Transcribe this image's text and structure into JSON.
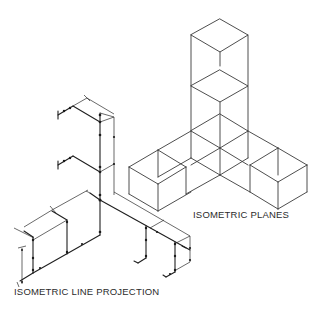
{
  "figure": {
    "labels": {
      "isometric_planes": "ISOMETRIC PLANES",
      "isometric_line_projection": "ISOMETRIC LINE PROJECTION"
    },
    "colors": {
      "background": "#ffffff",
      "line": "#3a3a3a",
      "text": "#2b2b2b"
    },
    "sections": [
      {
        "id": "isometric-planes",
        "description": "Stacked isometric cube wireframes in T arrangement"
      },
      {
        "id": "isometric-line-projection",
        "description": "Isometric piping line drawing with dimension lines and joints"
      }
    ]
  }
}
